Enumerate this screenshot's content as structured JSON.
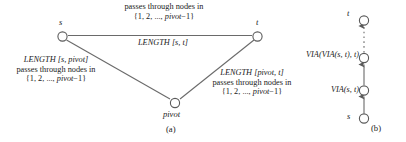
{
  "figure": {
    "panel_a": {
      "tag": "(a)",
      "nodes": [
        {
          "name": "s",
          "id": "node-s"
        },
        {
          "name": "t",
          "id": "node-t"
        },
        {
          "name": "pivot",
          "id": "node-pivot"
        }
      ],
      "top_edge_label": {
        "line1": "passes through nodes in",
        "line2_prefix": "{1, 2, ..., ",
        "line2_italic": "pivot",
        "line2_suffix": "−1}"
      },
      "top_edge_length": {
        "func": "LENGTH",
        "args": "[s, t]"
      },
      "left_edge_label": {
        "func": "LENGTH",
        "args": "[s, pivot]",
        "line2": "passes through nodes in",
        "line3_prefix": "{1, 2, ..., ",
        "line3_italic": "pivot",
        "line3_suffix": "−1}"
      },
      "right_edge_label": {
        "func": "LENGTH",
        "args": "[pivot, t]",
        "line2": "passes through nodes in",
        "line3_prefix": "{1, 2, ..., ",
        "line3_italic": "pivot",
        "line3_suffix": "−1}"
      }
    },
    "panel_b": {
      "tag": "(b)",
      "nodes": [
        {
          "name": "t",
          "id": "node-b-t"
        },
        {
          "name": "",
          "id": "node-b-via2"
        },
        {
          "name": "",
          "id": "node-b-via1"
        },
        {
          "name": "s",
          "id": "node-b-s"
        }
      ],
      "labels": {
        "via2": "VIA(VIA(s, t), t)",
        "via1": "VIA(s, t)"
      }
    },
    "colors": {
      "line": "#555555",
      "node_stroke": "#555555",
      "text": "#1a1a1a",
      "background": "#ffffff"
    }
  }
}
